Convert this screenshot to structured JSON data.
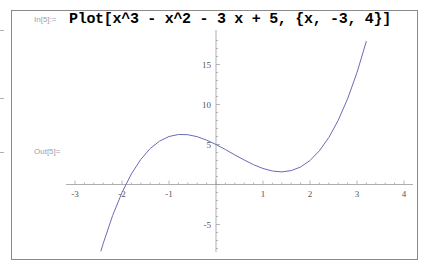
{
  "notebook": {
    "input_label": "In[5]:=",
    "input_code": "Plot[x^3 - x^2 - 3 x + 5, {x, -3, 4}]",
    "output_label": "Out[5]="
  },
  "chart_data": {
    "type": "line",
    "title": "",
    "function": "x^3 - x^2 - 3x + 5",
    "xlabel": "",
    "ylabel": "",
    "xlim": [
      -3.2,
      4.2
    ],
    "ylim": [
      -8.5,
      19
    ],
    "x_ticks": [
      "-3",
      "-2",
      "-1",
      "1",
      "2",
      "3",
      "4"
    ],
    "y_ticks": [
      "-5",
      "5",
      "10",
      "15"
    ],
    "grid": false,
    "series": [
      {
        "name": "x^3 - x^2 - 3x + 5",
        "color": "#6b6bb8",
        "x": [
          -2.45,
          -2.4,
          -2.2,
          -2.0,
          -1.8,
          -1.6,
          -1.4,
          -1.2,
          -1.0,
          -0.8,
          -0.6,
          -0.4,
          -0.2,
          0,
          0.2,
          0.4,
          0.6,
          0.8,
          1.0,
          1.2,
          1.4,
          1.6,
          1.8,
          2.0,
          2.2,
          2.4,
          2.6,
          2.8,
          3.0,
          3.2
        ],
        "y": [
          -8.36,
          -7.38,
          -3.89,
          -1,
          1.33,
          3.14,
          4.5,
          5.43,
          6,
          6.25,
          6.22,
          5.98,
          5.55,
          5,
          4.37,
          3.7,
          3.06,
          2.47,
          2,
          1.69,
          1.58,
          1.74,
          2.19,
          3,
          4.21,
          5.86,
          8.02,
          10.71,
          14,
          17.93
        ]
      }
    ]
  },
  "colors": {
    "curve": "#6b6bb8",
    "frame": "#8a8a8a",
    "axis": "#9a9a9a",
    "label": "#9aa0b4"
  }
}
